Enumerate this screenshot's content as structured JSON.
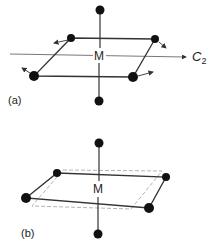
{
  "panels": [
    {
      "id": "a",
      "label": "(a)",
      "center_label": "M",
      "axis_label": "C",
      "axis_subscript": "2",
      "description": "Square-planar complex with axial ligands; in-plane ligand displacements (arrows) about C2 axis"
    },
    {
      "id": "b",
      "label": "(b)",
      "center_label": "M",
      "description": "Distorted (rotated) square plane shown against dashed original square"
    }
  ],
  "colors": {
    "line": "#333333",
    "atom": "#111111",
    "dashed": "#aaaaaa"
  }
}
